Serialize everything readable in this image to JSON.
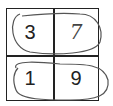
{
  "grid": {
    "rows": 2,
    "cols": 2,
    "cells": [
      [
        "3",
        "7"
      ],
      [
        "1",
        "9"
      ]
    ]
  },
  "annotations": {
    "loops": [
      "row-1-loop",
      "row-2-loop"
    ],
    "loop_color": "#555555"
  }
}
